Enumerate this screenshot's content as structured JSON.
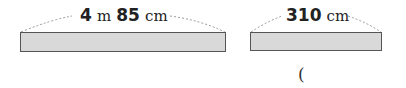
{
  "figures": [
    {
      "label": {
        "value1": "4",
        "unit1": "m",
        "value2": "85",
        "unit2": "cm"
      },
      "bar_color": "#d9d9d9"
    },
    {
      "label": {
        "value1": "310",
        "unit1": "cm"
      },
      "bar_color": "#d9d9d9"
    }
  ],
  "answer": {
    "open_paren": "("
  }
}
